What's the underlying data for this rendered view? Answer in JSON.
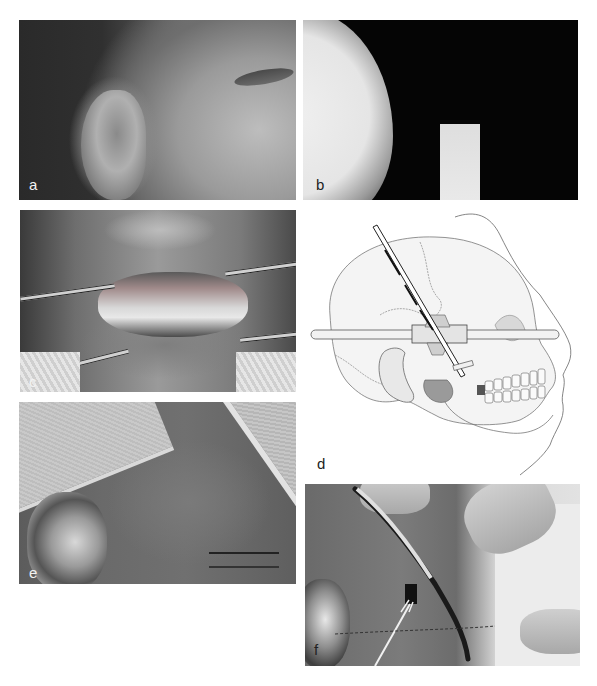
{
  "figure": {
    "panels": [
      {
        "id": "a",
        "label": "a",
        "content": "lateral face photograph showing ear and eye"
      },
      {
        "id": "b",
        "label": "b",
        "content": "radiograph, soft tissue profile with radiopaque bar"
      },
      {
        "id": "c",
        "label": "c",
        "content": "intraoral photograph with cheek retractors"
      },
      {
        "id": "d",
        "label": "d",
        "content": "illustration of skull with instrument and horizontal rod"
      },
      {
        "id": "e",
        "label": "e",
        "content": "preauricular skin with marked incision line"
      },
      {
        "id": "f",
        "label": "f",
        "content": "surgical dissection with instrument and skin hook"
      }
    ]
  },
  "colors": {
    "background": "#ffffff",
    "label_light": "#f2f2f2",
    "label_dark": "#222222"
  }
}
